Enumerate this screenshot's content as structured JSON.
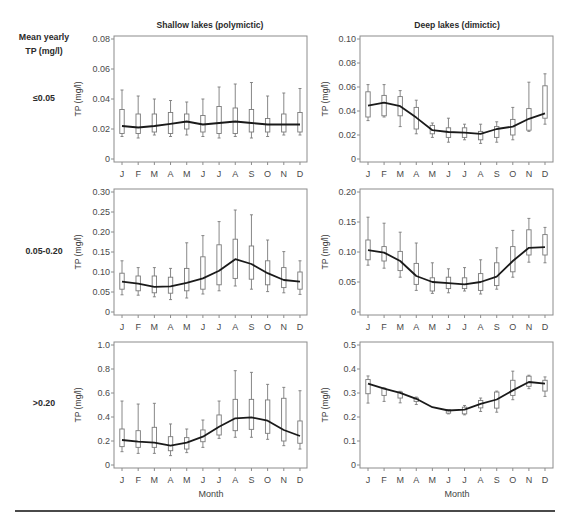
{
  "figure": {
    "row_header": [
      "Mean yearly",
      "TP (mg/l)"
    ],
    "columns": [
      {
        "title": "Shallow lakes (polymictic)"
      },
      {
        "title": "Deep lakes (dimictic)"
      }
    ],
    "rows": [
      {
        "label": "≤0.05"
      },
      {
        "label": "0.05-0.20"
      },
      {
        "label": ">0.20"
      }
    ],
    "x_axis_label": "Month",
    "colors": {
      "line": "#1a1a1a",
      "box": "#7a7a7a",
      "frame": "#8c8c8c"
    }
  },
  "chart_data": [
    {
      "type": "box",
      "column_title": "Shallow lakes (polymictic)",
      "row_label": "≤0.05",
      "xlabel": "",
      "ylabel": "TP (mg/l)",
      "categories": [
        "J",
        "F",
        "M",
        "A",
        "M",
        "J",
        "J",
        "A",
        "S",
        "O",
        "N",
        "D"
      ],
      "ylim": [
        0,
        0.08
      ],
      "yticks": [
        0,
        0.02,
        0.04,
        0.06,
        0.08
      ],
      "ytick_labels": [
        "0",
        "0.02",
        "0.04",
        "0.06",
        "0.08"
      ],
      "grid": false,
      "series": [
        {
          "name": "line",
          "values": [
            0.022,
            0.021,
            0.022,
            0.0235,
            0.025,
            0.023,
            0.024,
            0.025,
            0.024,
            0.023,
            0.023,
            0.023
          ]
        }
      ],
      "boxes": {
        "whisker_high": [
          0.046,
          0.042,
          0.04,
          0.039,
          0.038,
          0.04,
          0.048,
          0.05,
          0.051,
          0.042,
          0.044,
          0.047
        ],
        "q3": [
          0.033,
          0.03,
          0.03,
          0.031,
          0.03,
          0.029,
          0.035,
          0.034,
          0.033,
          0.027,
          0.03,
          0.031
        ],
        "q1": [
          0.017,
          0.017,
          0.018,
          0.017,
          0.02,
          0.018,
          0.017,
          0.017,
          0.018,
          0.018,
          0.018,
          0.018
        ],
        "whisker_low": [
          0.015,
          0.014,
          0.016,
          0.015,
          0.016,
          0.015,
          0.014,
          0.015,
          0.014,
          0.015,
          0.016,
          0.016
        ]
      }
    },
    {
      "type": "box",
      "column_title": "Deep lakes (dimictic)",
      "row_label": "≤0.05",
      "xlabel": "",
      "ylabel": "TP (mg/l)",
      "categories": [
        "J",
        "F",
        "M",
        "A",
        "M",
        "J",
        "J",
        "A",
        "S",
        "O",
        "N",
        "D"
      ],
      "ylim": [
        0,
        0.1
      ],
      "yticks": [
        0,
        0.02,
        0.04,
        0.06,
        0.08,
        0.1
      ],
      "ytick_labels": [
        "0",
        "0.02",
        "0.04",
        "0.06",
        "0.08",
        "0.10"
      ],
      "grid": false,
      "series": [
        {
          "name": "line",
          "values": [
            0.0445,
            0.047,
            0.044,
            0.0345,
            0.024,
            0.0225,
            0.022,
            0.021,
            0.025,
            0.027,
            0.0335,
            0.038
          ]
        }
      ],
      "boxes": {
        "whisker_high": [
          0.062,
          0.062,
          0.057,
          0.049,
          0.03,
          0.034,
          0.029,
          0.029,
          0.031,
          0.043,
          0.064,
          0.071
        ],
        "q3": [
          0.056,
          0.053,
          0.052,
          0.043,
          0.028,
          0.026,
          0.026,
          0.023,
          0.027,
          0.033,
          0.042,
          0.061
        ],
        "q1": [
          0.035,
          0.036,
          0.036,
          0.025,
          0.021,
          0.018,
          0.018,
          0.016,
          0.018,
          0.02,
          0.024,
          0.034
        ],
        "whisker_low": [
          0.032,
          0.035,
          0.027,
          0.021,
          0.018,
          0.014,
          0.016,
          0.013,
          0.014,
          0.016,
          0.023,
          0.029
        ]
      }
    },
    {
      "type": "box",
      "column_title": "Shallow lakes (polymictic)",
      "row_label": "0.05-0.20",
      "xlabel": "",
      "ylabel": "TP (mg/l)",
      "categories": [
        "J",
        "F",
        "M",
        "A",
        "M",
        "J",
        "J",
        "A",
        "S",
        "O",
        "N",
        "D"
      ],
      "ylim": [
        0,
        0.3
      ],
      "yticks": [
        0,
        0.05,
        0.1,
        0.15,
        0.2,
        0.25,
        0.3
      ],
      "ytick_labels": [
        "0",
        "0.05",
        "0.10",
        "0.15",
        "0.20",
        "0.25",
        "0.30"
      ],
      "grid": false,
      "series": [
        {
          "name": "line",
          "values": [
            0.076,
            0.071,
            0.063,
            0.064,
            0.073,
            0.084,
            0.103,
            0.132,
            0.12,
            0.097,
            0.08,
            0.076
          ]
        }
      ],
      "boxes": {
        "whisker_high": [
          0.128,
          0.111,
          0.111,
          0.109,
          0.173,
          0.191,
          0.226,
          0.255,
          0.243,
          0.18,
          0.151,
          0.128
        ],
        "q3": [
          0.097,
          0.09,
          0.09,
          0.087,
          0.109,
          0.138,
          0.168,
          0.182,
          0.165,
          0.128,
          0.111,
          0.1
        ],
        "q1": [
          0.057,
          0.053,
          0.048,
          0.047,
          0.053,
          0.057,
          0.068,
          0.084,
          0.082,
          0.068,
          0.061,
          0.057
        ],
        "whisker_low": [
          0.043,
          0.042,
          0.038,
          0.031,
          0.035,
          0.045,
          0.053,
          0.065,
          0.057,
          0.051,
          0.048,
          0.044
        ]
      }
    },
    {
      "type": "box",
      "column_title": "Deep lakes (dimictic)",
      "row_label": "0.05-0.20",
      "xlabel": "",
      "ylabel": "TP (mg/l)",
      "categories": [
        "J",
        "F",
        "M",
        "A",
        "M",
        "J",
        "J",
        "A",
        "S",
        "O",
        "N",
        "D"
      ],
      "ylim": [
        0,
        0.2
      ],
      "yticks": [
        0,
        0.05,
        0.1,
        0.15,
        0.2
      ],
      "ytick_labels": [
        "0",
        "0.05",
        "0.10",
        "0.15",
        "0.20"
      ],
      "grid": false,
      "series": [
        {
          "name": "line",
          "values": [
            0.103,
            0.099,
            0.085,
            0.06,
            0.05,
            0.048,
            0.046,
            0.05,
            0.059,
            0.085,
            0.107,
            0.108
          ]
        }
      ],
      "boxes": {
        "whisker_high": [
          0.158,
          0.148,
          0.133,
          0.115,
          0.082,
          0.072,
          0.074,
          0.087,
          0.107,
          0.136,
          0.156,
          0.141
        ],
        "q3": [
          0.12,
          0.109,
          0.101,
          0.081,
          0.057,
          0.058,
          0.057,
          0.064,
          0.082,
          0.109,
          0.137,
          0.129
        ],
        "q1": [
          0.087,
          0.085,
          0.069,
          0.046,
          0.035,
          0.039,
          0.039,
          0.036,
          0.044,
          0.067,
          0.095,
          0.095
        ],
        "whisker_low": [
          0.078,
          0.073,
          0.058,
          0.036,
          0.031,
          0.032,
          0.035,
          0.03,
          0.038,
          0.058,
          0.083,
          0.082
        ]
      }
    },
    {
      "type": "box",
      "column_title": "Shallow lakes (polymictic)",
      "row_label": ">0.20",
      "xlabel": "Month",
      "ylabel": "TP (mg/l)",
      "categories": [
        "J",
        "F",
        "M",
        "A",
        "M",
        "J",
        "J",
        "A",
        "S",
        "O",
        "N",
        "D"
      ],
      "ylim": [
        0,
        1.0
      ],
      "yticks": [
        0,
        0.2,
        0.4,
        0.6,
        0.8,
        1.0
      ],
      "ytick_labels": [
        "0",
        "0.2",
        "0.4",
        "0.6",
        "0.8",
        "1.0"
      ],
      "grid": false,
      "series": [
        {
          "name": "line",
          "values": [
            0.208,
            0.194,
            0.186,
            0.161,
            0.186,
            0.236,
            0.319,
            0.389,
            0.397,
            0.369,
            0.292,
            0.242
          ]
        }
      ],
      "boxes": {
        "whisker_high": [
          0.533,
          0.508,
          0.514,
          0.342,
          0.3,
          0.375,
          0.533,
          0.786,
          0.772,
          0.672,
          0.647,
          0.619
        ],
        "q3": [
          0.3,
          0.286,
          0.314,
          0.236,
          0.228,
          0.292,
          0.417,
          0.547,
          0.547,
          0.542,
          0.556,
          0.367
        ],
        "q1": [
          0.153,
          0.147,
          0.147,
          0.119,
          0.133,
          0.194,
          0.25,
          0.286,
          0.297,
          0.264,
          0.2,
          0.181
        ],
        "whisker_low": [
          0.111,
          0.097,
          0.097,
          0.078,
          0.103,
          0.147,
          0.222,
          0.231,
          0.231,
          0.214,
          0.161,
          0.133
        ]
      }
    },
    {
      "type": "box",
      "column_title": "Deep lakes (dimictic)",
      "row_label": ">0.20",
      "xlabel": "Month",
      "ylabel": "TP (mg/l)",
      "categories": [
        "J",
        "F",
        "M",
        "A",
        "M",
        "J",
        "J",
        "A",
        "S",
        "O",
        "N",
        "D"
      ],
      "ylim": [
        0,
        0.5
      ],
      "yticks": [
        0,
        0.1,
        0.2,
        0.3,
        0.4,
        0.5
      ],
      "ytick_labels": [
        "0",
        "0.1",
        "0.2",
        "0.3",
        "0.4",
        "0.5"
      ],
      "grid": false,
      "series": [
        {
          "name": "line",
          "values": [
            0.339,
            0.318,
            0.301,
            0.276,
            0.241,
            0.227,
            0.231,
            0.255,
            0.273,
            0.311,
            0.346,
            0.339
          ]
        }
      ],
      "boxes": {
        "whisker_high": [
          0.371,
          0.322,
          0.307,
          0.283,
          null,
          0.231,
          0.248,
          0.279,
          0.308,
          0.391,
          0.374,
          0.367
        ],
        "q3": [
          0.356,
          0.318,
          0.304,
          0.279,
          null,
          0.23,
          0.241,
          0.269,
          0.304,
          0.353,
          0.37,
          0.353
        ],
        "q1": [
          0.297,
          0.29,
          0.279,
          0.265,
          null,
          0.216,
          0.213,
          0.238,
          0.237,
          0.29,
          0.328,
          0.308
        ],
        "whisker_low": [
          0.258,
          0.265,
          0.259,
          0.252,
          null,
          0.213,
          0.209,
          0.223,
          0.22,
          0.272,
          0.318,
          0.286
        ]
      }
    }
  ]
}
